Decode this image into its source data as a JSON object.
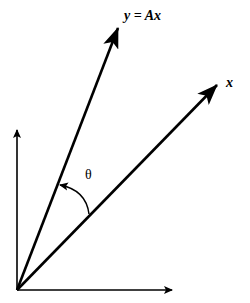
{
  "diagram": {
    "type": "vector-rotation",
    "colors": {
      "background": "#ffffff",
      "stroke": "#000000"
    },
    "origin": [
      17,
      290
    ],
    "axes": {
      "horizontal_tip": [
        173,
        290
      ],
      "vertical_tip": [
        17,
        129
      ]
    },
    "vectors": {
      "x": {
        "tip": [
          218,
          84
        ],
        "label": "x"
      },
      "y": {
        "tip": [
          119,
          27
        ],
        "label": "y = Ax"
      }
    },
    "angle": {
      "label": "θ",
      "arc_from": [
        89,
        214
      ],
      "arc_to": [
        59,
        185
      ]
    }
  }
}
